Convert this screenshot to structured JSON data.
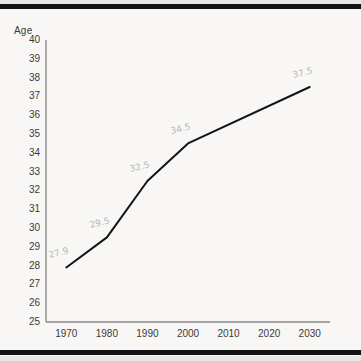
{
  "document": {
    "kind": "scanned-page",
    "page_background": "#f8f7f5",
    "scan_bar_color": "#121212"
  },
  "chart_data": {
    "type": "line",
    "title": "",
    "xlabel": "",
    "ylabel": "Age",
    "ylim": [
      25,
      40
    ],
    "xlim": [
      1965,
      2035
    ],
    "grid": false,
    "legend": null,
    "x": [
      1970,
      1980,
      1990,
      2000,
      2030
    ],
    "values": [
      27.9,
      29.5,
      32.5,
      34.5,
      37.5
    ],
    "series": [
      {
        "name": "Age",
        "x": [
          1970,
          1980,
          1990,
          2000,
          2030
        ],
        "values": [
          27.9,
          29.5,
          32.5,
          34.5,
          37.5
        ],
        "color": "#141414"
      }
    ],
    "xtick_labels": [
      "1970",
      "1980",
      "1990",
      "2000",
      "2010",
      "2020",
      "2030"
    ],
    "xticks": [
      1970,
      1980,
      1990,
      2000,
      2010,
      2020,
      2030
    ],
    "ytick_labels": [
      "40",
      "39",
      "38",
      "37",
      "36",
      "35",
      "34",
      "33",
      "32",
      "31",
      "30",
      "29",
      "28",
      "27",
      "26",
      "25"
    ],
    "yticks": [
      40,
      39,
      38,
      37,
      36,
      35,
      34,
      33,
      32,
      31,
      30,
      29,
      28,
      27,
      26,
      25
    ],
    "annotations": [
      {
        "text": "27.9",
        "x": 1970,
        "y": 27.9
      },
      {
        "text": "29.5",
        "x": 1980,
        "y": 29.5
      },
      {
        "text": "32.5",
        "x": 1990,
        "y": 32.5
      },
      {
        "text": "34.5",
        "x": 2000,
        "y": 34.5
      },
      {
        "text": "37.5",
        "x": 2030,
        "y": 37.5
      }
    ]
  },
  "axis": {
    "y_title": "Age",
    "line_color": "#8a8a8a"
  }
}
